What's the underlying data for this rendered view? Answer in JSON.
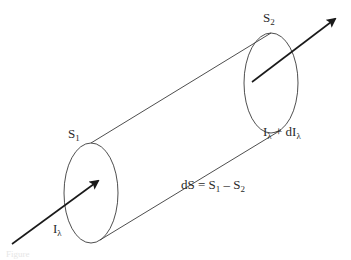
{
  "figure": {
    "type": "radiative-transfer-cylinder",
    "colors": {
      "stroke": "#3a3a3a",
      "arrow": "#1a1a1a",
      "text": "#2a2a2a",
      "background": "#ffffff"
    },
    "labels": {
      "s1": {
        "base": "S",
        "sub": "1"
      },
      "s2": {
        "base": "S",
        "sub": "2"
      },
      "incident": {
        "base": "I",
        "sub": "λ"
      },
      "outgoing": {
        "base": "I",
        "sub": "λ",
        "plus": " + dI",
        "sub2": "λ"
      },
      "ds_equation": {
        "lhs": "dS = S",
        "sub1": "1",
        "minus": " – S",
        "sub2": "2"
      }
    },
    "caption": "Figure"
  }
}
